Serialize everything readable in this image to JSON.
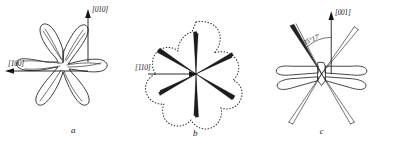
{
  "figure": {
    "background_color": "#ffffff",
    "ink_color": "#1d1d1d"
  },
  "panels": [
    {
      "id": "a",
      "letter": "a",
      "petal_count": 6,
      "outline_style": "solid",
      "axes": [
        {
          "name": "vertical-axis",
          "label": "[010]",
          "direction": "up"
        },
        {
          "name": "horizontal-axis",
          "label": "[100]",
          "direction": "left"
        }
      ],
      "angle_annotation": null
    },
    {
      "id": "b",
      "letter": "b",
      "petal_count": 6,
      "outline_style": "dotted",
      "axes": [
        {
          "name": "horizontal-axis",
          "label": "[110]",
          "direction": "right"
        }
      ],
      "angle_annotation": null
    },
    {
      "id": "c",
      "letter": "c",
      "petal_count": 6,
      "outline_style": "solid",
      "axes": [
        {
          "name": "vertical-axis",
          "label": "[001]",
          "direction": "up"
        }
      ],
      "angle_annotation": {
        "name": "angle-label",
        "value": "35°17'"
      }
    }
  ]
}
